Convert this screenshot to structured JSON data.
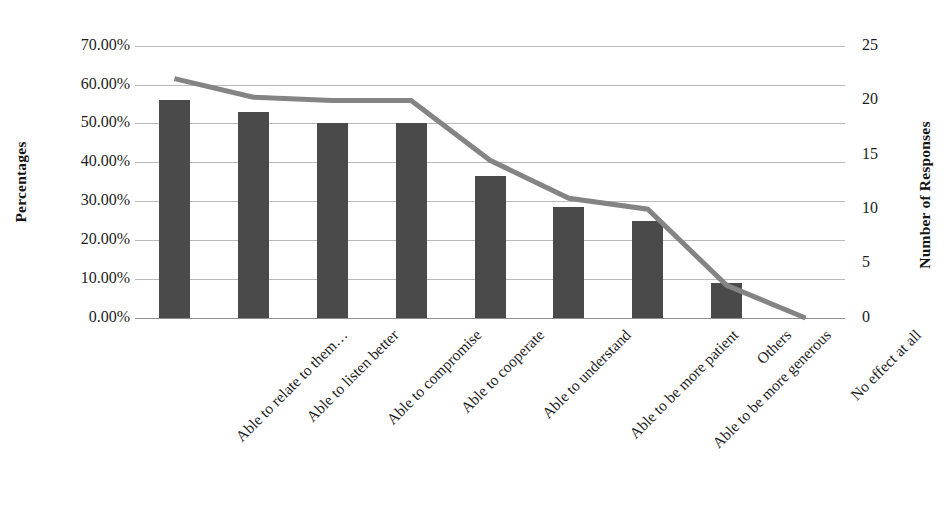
{
  "chart_data": {
    "type": "bar",
    "title": "",
    "subtitle": "",
    "categories": [
      "Able to relate to them…",
      "Able to listen better",
      "Able to compromise",
      "Able to cooperate",
      "Able to understand",
      "Able to be more patient",
      "Able to be more generous",
      "Others",
      "No effect at all"
    ],
    "series": [
      {
        "name": "Percentages",
        "type": "bar",
        "axis": "left",
        "color": "#4a4a4a",
        "values": [
          56.0,
          53.0,
          50.0,
          50.0,
          36.5,
          28.5,
          25.0,
          9.0,
          0.0
        ]
      },
      {
        "name": "Number of Responses",
        "type": "line",
        "axis": "right",
        "color": "#848484",
        "values": [
          22,
          20.3,
          20,
          20,
          14.5,
          11,
          10,
          3,
          0
        ]
      }
    ],
    "xlabel": "",
    "ylabel": "Percentages",
    "y2label": "Number of Responses",
    "ylim": [
      0,
      70
    ],
    "y2lim": [
      0,
      25
    ],
    "yticks": [
      0,
      10,
      20,
      30,
      40,
      50,
      60,
      70
    ],
    "ytick_labels": [
      "0.00%",
      "10.00%",
      "20.00%",
      "30.00%",
      "40.00%",
      "50.00%",
      "60.00%",
      "70.00%"
    ],
    "y2ticks": [
      0,
      5,
      10,
      15,
      20,
      25
    ],
    "y2tick_labels": [
      "0",
      "5",
      "10",
      "15",
      "20",
      "25"
    ],
    "grid": true,
    "grid_color": "#b9b9b9",
    "legend": false,
    "legend_position": "none",
    "background": "#ffffff"
  },
  "axes": {
    "left_title": "Percentages",
    "right_title": "Number of Responses"
  }
}
